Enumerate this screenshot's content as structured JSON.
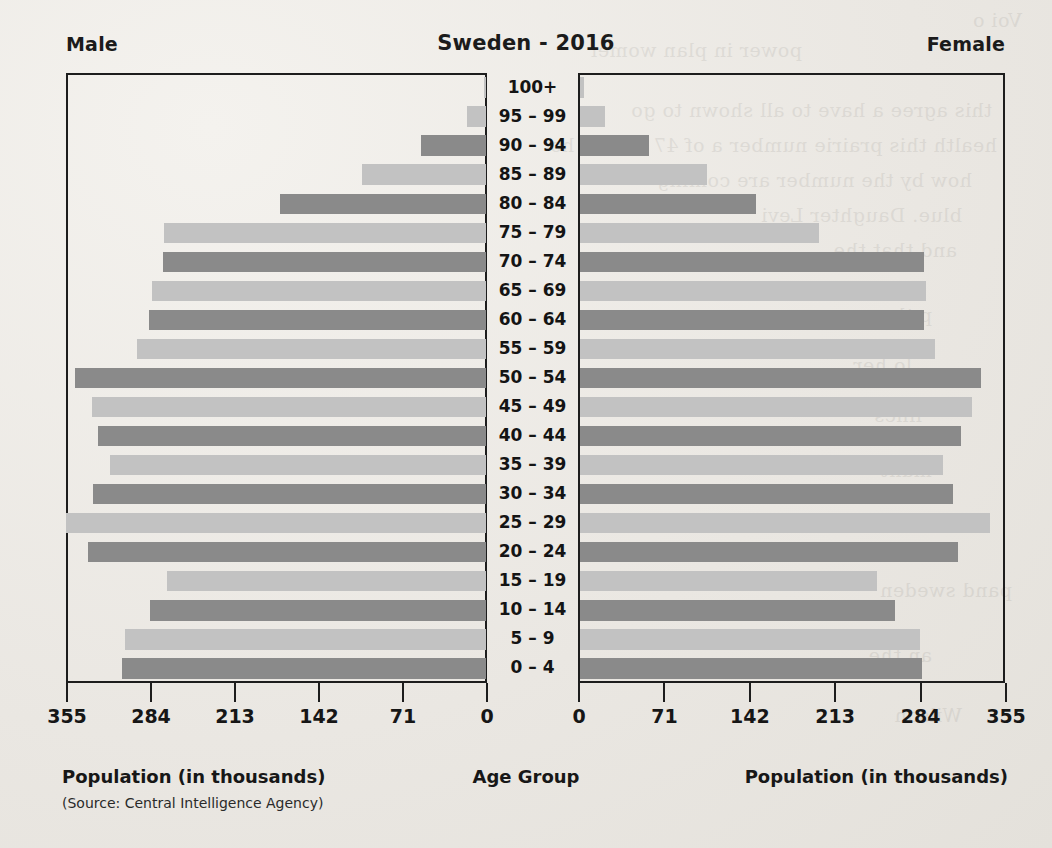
{
  "header": {
    "left_label": "Male",
    "title": "Sweden - 2016",
    "right_label": "Female"
  },
  "footer": {
    "left_axis_label": "Population (in thousands)",
    "center_axis_label": "Age Group",
    "right_axis_label": "Population (in thousands)",
    "source": "(Source: Central Intelligence Agency)"
  },
  "colors": {
    "bar_dark": "#8a8a8a",
    "bar_light": "#c2c2c2",
    "axis": "#1d1d1d",
    "background": "#eceae6",
    "text": "#141414"
  },
  "axis": {
    "male_ticks": [
      "355",
      "284",
      "213",
      "142",
      "71",
      "0"
    ],
    "female_ticks": [
      "0",
      "71",
      "142",
      "213",
      "284",
      "355"
    ],
    "max": 355,
    "tick_step": 71
  },
  "chart_data": {
    "type": "bar",
    "title": "Sweden - 2016",
    "subtype": "population-pyramid",
    "xlabel": "Population (in thousands)",
    "ylabel": "Age Group",
    "xlim": [
      0,
      355
    ],
    "grid": false,
    "legend": [
      "Male",
      "Female"
    ],
    "categories": [
      "100+",
      "95 – 99",
      "90 – 94",
      "85 – 89",
      "80 – 84",
      "75 – 79",
      "70 – 74",
      "65 – 69",
      "60 – 64",
      "55 – 59",
      "50 – 54",
      "45 – 49",
      "40 – 44",
      "35 – 39",
      "30 – 34",
      "25 – 29",
      "20 – 24",
      "15 – 19",
      "10 – 14",
      "5 – 9",
      "0 – 4"
    ],
    "series": [
      {
        "name": "Male",
        "side": "left",
        "values": [
          2,
          16,
          55,
          105,
          174,
          272,
          273,
          282,
          285,
          295,
          347,
          333,
          328,
          318,
          332,
          355,
          336,
          270,
          284,
          305,
          308
        ]
      },
      {
        "name": "Female",
        "side": "right",
        "values": [
          3,
          21,
          57,
          106,
          146,
          199,
          286,
          288,
          286,
          295,
          333,
          326,
          317,
          302,
          310,
          341,
          314,
          247,
          262,
          283,
          284
        ]
      }
    ],
    "row_colors": [
      "light",
      "light",
      "dark",
      "light",
      "dark",
      "light",
      "dark",
      "light",
      "dark",
      "light",
      "dark",
      "light",
      "dark",
      "light",
      "dark",
      "light",
      "dark",
      "light",
      "dark",
      "light",
      "dark"
    ]
  },
  "bleed_text": [
    "Voi o",
    "power in plan womer",
    "this agree a have to all shown to go",
    "health this prairie number a of 47 and sá ho",
    "how by the number are coming",
    "blue. Daughter Levi",
    "and that the",
    "p the",
    "lo her",
    "lines",
    "mant",
    "and a",
    "pand sweden",
    "an the",
    "Wilson"
  ]
}
